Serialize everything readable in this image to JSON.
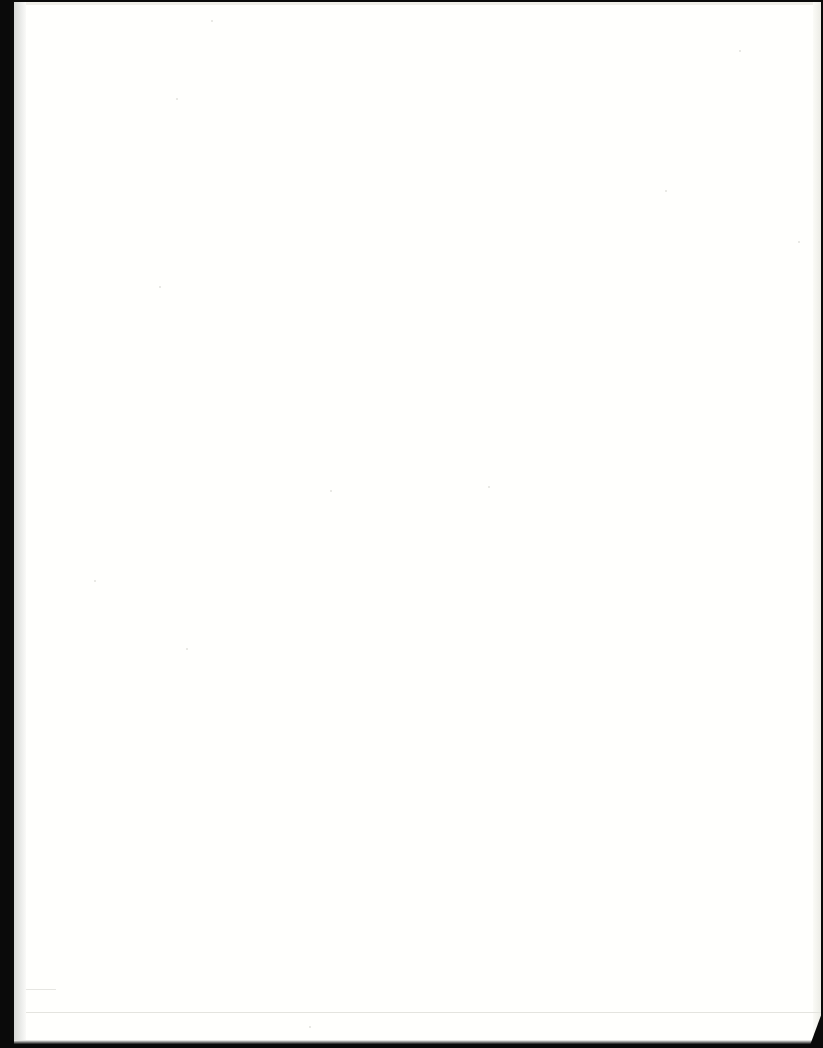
{
  "document": {
    "type": "scanned-page",
    "content": "",
    "is_blank": true
  },
  "colors": {
    "page": "#fffffd",
    "scanner_background": "#0a0a0a",
    "edge_shadow": "#d6d8d6",
    "fold_line": "#e4e4df"
  }
}
